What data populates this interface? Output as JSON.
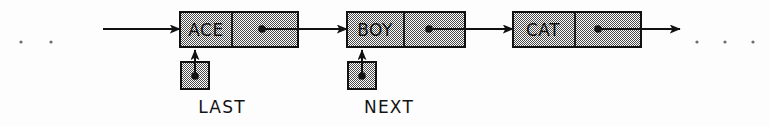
{
  "diagram": {
    "type": "linked-list",
    "title": "",
    "background_color": "#fdfdfd",
    "ink_color": "#111111",
    "node_fill": "#b8b8b8",
    "nodes": [
      {
        "key": "ACE",
        "id": "node-ace",
        "x": 180,
        "y": 12,
        "width": 118,
        "height": 35,
        "divider_x": 232
      },
      {
        "key": "BOY",
        "id": "node-boy",
        "x": 347,
        "y": 12,
        "width": 118,
        "height": 35,
        "divider_x": 404
      },
      {
        "key": "CAT",
        "id": "node-cat",
        "x": 513,
        "y": 12,
        "width": 128,
        "height": 35,
        "divider_x": 575
      }
    ],
    "pointers": [
      {
        "label": "LAST",
        "id": "pointer-last",
        "box_x": 181,
        "box_y": 62,
        "box_size": 28,
        "label_x": 222,
        "label_y": 113,
        "target": "ACE"
      },
      {
        "label": "NEXT",
        "id": "pointer-next",
        "box_x": 348,
        "box_y": 62,
        "box_size": 28,
        "label_x": 389,
        "label_y": 113,
        "target": "BOY"
      }
    ],
    "ellipsis_left": {
      "dots": 2,
      "x_positions": [
        21,
        51
      ],
      "y": 42
    },
    "ellipsis_right": {
      "dots": 3,
      "x_positions": [
        697,
        725,
        753
      ],
      "y": 42
    },
    "arrows": [
      {
        "id": "arrow-head-in",
        "from_x": 103,
        "to_x": 180,
        "y": 29
      },
      {
        "id": "arrow-ace-to-boy",
        "from_x": 262,
        "to_x": 347,
        "y": 29
      },
      {
        "id": "arrow-boy-to-cat",
        "from_x": 429,
        "to_x": 513,
        "y": 29
      },
      {
        "id": "arrow-cat-to-tail",
        "from_x": 598,
        "to_x": 680,
        "y": 29
      }
    ]
  }
}
